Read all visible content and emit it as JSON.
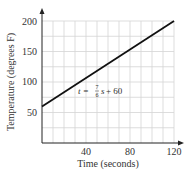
{
  "chart_data": {
    "type": "line",
    "title": "",
    "xlabel": "Time (seconds)",
    "ylabel": "Temperature (degrees F)",
    "xlim": [
      0,
      120
    ],
    "ylim": [
      0,
      200
    ],
    "x_ticks": [
      40,
      80,
      120
    ],
    "y_ticks": [
      50,
      100,
      150,
      200
    ],
    "x_tick_labels": [
      "40",
      "80",
      "120"
    ],
    "y_tick_labels": [
      "50",
      "100",
      "150",
      "200"
    ],
    "grid": true,
    "grid_x_step": 10,
    "grid_y_step": 25,
    "legend": null,
    "series": [
      {
        "name": "t = (7/6)s + 60",
        "x": [
          0,
          120
        ],
        "y": [
          60,
          200
        ]
      }
    ],
    "annotations": [
      {
        "text": "t = 7/6 s + 60",
        "x": 50,
        "y": 105
      }
    ]
  },
  "labels": {
    "xlabel": "Time (seconds)",
    "ylabel": "Temperature (degrees F)",
    "x_ticks": [
      "40",
      "80",
      "120"
    ],
    "y_ticks": [
      "50",
      "100",
      "150",
      "200"
    ],
    "equation": {
      "lhs": "t = ",
      "num": "7",
      "den": "6",
      "rhs_var": "s",
      "rhs_const": " + 60"
    }
  }
}
